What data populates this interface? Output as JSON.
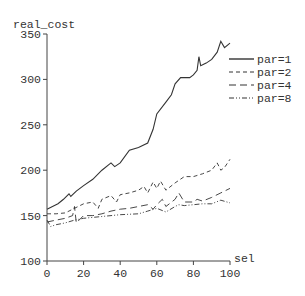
{
  "chart_data": {
    "type": "line",
    "title": "",
    "xlabel": "sel",
    "ylabel": "real_cost",
    "xlim": [
      0,
      100
    ],
    "ylim": [
      100,
      350
    ],
    "xticks": [
      0,
      20,
      40,
      60,
      80,
      100
    ],
    "yticks": [
      100,
      150,
      200,
      250,
      300,
      350
    ],
    "grid": false,
    "legend_position": "right, upper-middle",
    "series": [
      {
        "name": "par=1",
        "style": "solid",
        "x": [
          0,
          3,
          6,
          9,
          12,
          13,
          16,
          20,
          25,
          30,
          35,
          37,
          40,
          45,
          50,
          55,
          58,
          60,
          65,
          68,
          70,
          73,
          78,
          80,
          82,
          83,
          84,
          87,
          90,
          93,
          95,
          97,
          100
        ],
        "values": [
          157,
          160,
          163,
          168,
          174,
          171,
          177,
          183,
          190,
          200,
          208,
          204,
          208,
          222,
          225,
          230,
          245,
          262,
          275,
          283,
          295,
          302,
          302,
          305,
          310,
          325,
          315,
          318,
          322,
          330,
          342,
          335,
          340
        ]
      },
      {
        "name": "par=2",
        "style": "dashed",
        "x": [
          0,
          5,
          10,
          15,
          20,
          25,
          28,
          30,
          35,
          38,
          40,
          45,
          50,
          53,
          55,
          58,
          60,
          62,
          65,
          70,
          75,
          80,
          85,
          90,
          93,
          95,
          97,
          100
        ],
        "values": [
          152,
          152,
          153,
          158,
          163,
          165,
          158,
          168,
          172,
          165,
          173,
          175,
          178,
          182,
          175,
          187,
          180,
          188,
          178,
          186,
          193,
          193,
          196,
          200,
          208,
          200,
          203,
          212
        ]
      },
      {
        "name": "par=4",
        "style": "long-dash",
        "x": [
          0,
          5,
          10,
          14,
          15,
          16,
          20,
          25,
          30,
          35,
          40,
          45,
          50,
          55,
          58,
          60,
          63,
          65,
          70,
          72,
          75,
          80,
          82,
          85,
          90,
          95,
          100
        ],
        "values": [
          143,
          145,
          147,
          150,
          160,
          142,
          150,
          150,
          152,
          155,
          157,
          158,
          160,
          162,
          157,
          162,
          168,
          160,
          168,
          175,
          165,
          165,
          168,
          166,
          170,
          175,
          180
        ]
      },
      {
        "name": "par=8",
        "style": "dash-dot-dot",
        "x": [
          0,
          2,
          5,
          10,
          15,
          20,
          30,
          40,
          50,
          55,
          60,
          65,
          70,
          72,
          75,
          80,
          85,
          90,
          95,
          100
        ],
        "values": [
          145,
          138,
          140,
          142,
          145,
          147,
          149,
          151,
          152,
          155,
          158,
          154,
          160,
          162,
          161,
          162,
          163,
          163,
          167,
          164
        ]
      }
    ]
  },
  "axes": {
    "xlabel": "sel",
    "ylabel": "real_cost",
    "xtick_labels": [
      "0",
      "20",
      "40",
      "60",
      "80",
      "100"
    ],
    "ytick_labels": [
      "100",
      "150",
      "200",
      "250",
      "300",
      "350"
    ]
  },
  "legend": {
    "items": [
      {
        "label": "par=1",
        "style": "solid"
      },
      {
        "label": "par=2",
        "style": "dashed"
      },
      {
        "label": "par=4",
        "style": "long-dash"
      },
      {
        "label": "par=8",
        "style": "dash-dot-dot"
      }
    ]
  },
  "colors": {
    "line": "#333333",
    "axis": "#444444",
    "background": "#ffffff"
  }
}
